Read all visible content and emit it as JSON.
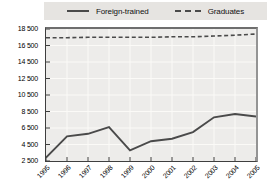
{
  "legend": {
    "items": [
      {
        "label": "Foreign-trained",
        "style": "solid"
      },
      {
        "label": "Graduates",
        "style": "dashed"
      }
    ]
  },
  "chart_data": {
    "type": "line",
    "categories": [
      "1995",
      "1996",
      "1997",
      "1998",
      "1999",
      "2000",
      "2001",
      "2002",
      "2003",
      "2004",
      "2005"
    ],
    "series": [
      {
        "name": "Foreign-trained",
        "style": "solid",
        "values": [
          2900,
          5500,
          5800,
          6600,
          3800,
          4900,
          5200,
          6000,
          7800,
          8200,
          7900
        ]
      },
      {
        "name": "Graduates",
        "style": "dashed",
        "values": [
          17450,
          17450,
          17500,
          17500,
          17500,
          17500,
          17550,
          17550,
          17650,
          17750,
          17900
        ]
      }
    ],
    "title": "",
    "xlabel": "",
    "ylabel": "",
    "ylim": [
      2500,
      18500
    ],
    "ytick_step": 2000,
    "ytick_labels_desc": [
      "18 500",
      "16 500",
      "14 500",
      "12 500",
      "10 500",
      "8 500",
      "6 500",
      "4 500",
      "2 500"
    ],
    "grid": true,
    "legend_position": "top",
    "colors": {
      "line": "#4a4a4a",
      "plot_bg": "#edecea",
      "legend_bg": "#e6e4e1",
      "grid": "#fbfaf7",
      "axis": "#3f3f3f"
    }
  }
}
